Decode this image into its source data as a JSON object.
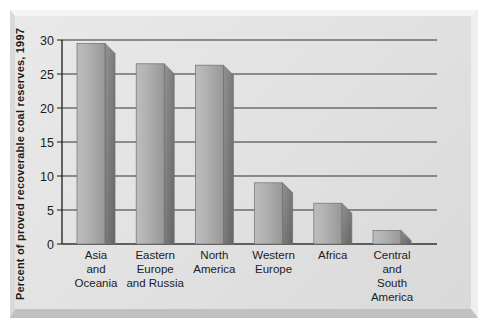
{
  "chart_data": {
    "type": "bar",
    "title": "",
    "xlabel": "",
    "ylabel": "Percent of proved recoverable coal reserves, 1997",
    "categories": [
      "Asia and Oceania",
      "Eastern Europe and Russia",
      "North America",
      "Western Europe",
      "Africa",
      "Central and South America"
    ],
    "category_lines": [
      [
        "Asia",
        "and",
        "Oceania"
      ],
      [
        "Eastern",
        "Europe",
        "and Russia"
      ],
      [
        "North",
        "America"
      ],
      [
        "Western",
        "Europe"
      ],
      [
        "Africa"
      ],
      [
        "Central",
        "and",
        "South",
        "America"
      ]
    ],
    "values": [
      29.5,
      26.5,
      26.3,
      9,
      6,
      2
    ],
    "ylim": [
      0,
      30
    ],
    "yticks": [
      0,
      5,
      10,
      15,
      20,
      25,
      30
    ],
    "grid": true,
    "legend": false,
    "style": "3d-gray-bars-on-embossed-gray-panel"
  },
  "colors": {
    "page_bg": "#ffffff",
    "panel_bg": "#e1e1e1",
    "bevel_top": "#f5f5f5",
    "bevel_left": "#d9d9d9",
    "bevel_right": "#efefef",
    "bevel_bottom": "#c0c0c0",
    "grid_line": "#333333",
    "axis_line": "#2a2a2a",
    "bar_front_light": "#bcbcbc",
    "bar_front_mid": "#b3b3b3",
    "bar_front_dark": "#979797",
    "bar_side_light": "#929292",
    "bar_side_dark": "#656565",
    "bar_edge": "#6f6f6f",
    "text": "#1c1c1c"
  }
}
